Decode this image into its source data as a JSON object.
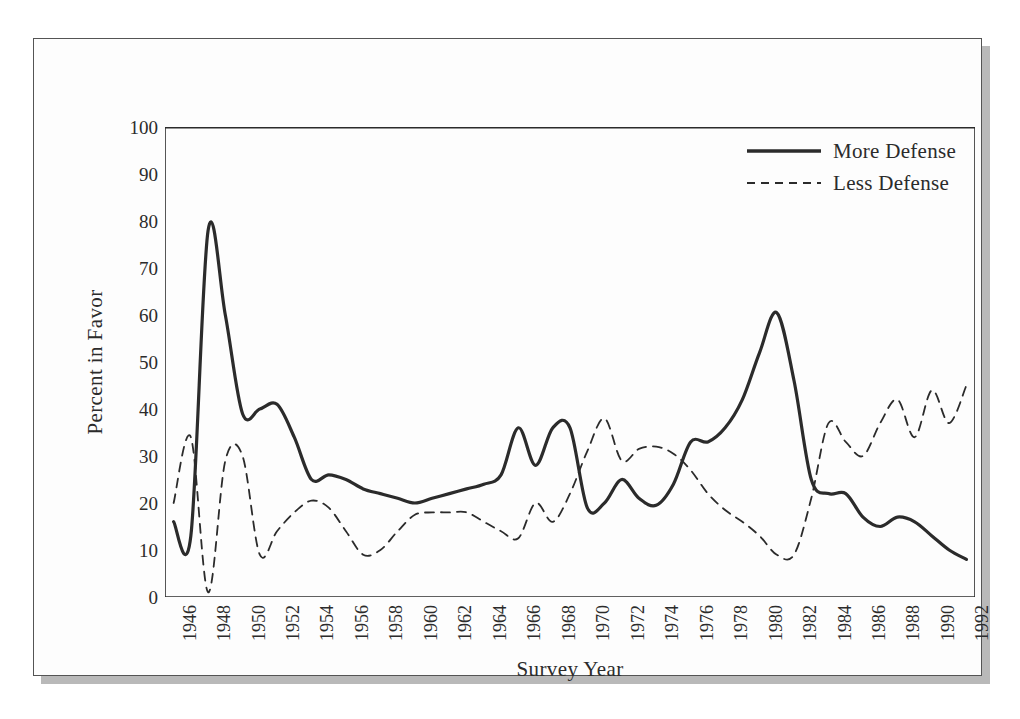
{
  "figure": {
    "frame_color": "#545454",
    "paper_color": "#fdfdfd",
    "shadow_color": "#b9b9b9",
    "line_color": "#2b2b2b"
  },
  "chart_data": {
    "type": "line",
    "title": "",
    "subtitle": "",
    "xlabel": "Survey Year",
    "ylabel": "Percent in Favor",
    "xlim": [
      1945.5,
      1992.5
    ],
    "ylim": [
      0,
      100
    ],
    "grid": false,
    "legend_position": "top-right",
    "y_ticks": [
      0,
      10,
      20,
      30,
      40,
      50,
      60,
      70,
      80,
      90,
      100
    ],
    "y_tick_labels": [
      "0",
      "10",
      "20",
      "30",
      "40",
      "50",
      "60",
      "70",
      "80",
      "90",
      "100"
    ],
    "x_ticks_minor_every": 1,
    "x_tick_labels": [
      "1946",
      "1948",
      "1950",
      "1952",
      "1954",
      "1956",
      "1958",
      "1960",
      "1962",
      "1964",
      "1966",
      "1968",
      "1970",
      "1972",
      "1974",
      "1976",
      "1978",
      "1980",
      "1982",
      "1984",
      "1986",
      "1988",
      "1990",
      "1992"
    ],
    "x_tick_label_rotation": -90,
    "x": [
      1946,
      1947,
      1948,
      1949,
      1950,
      1951,
      1952,
      1953,
      1954,
      1955,
      1956,
      1957,
      1958,
      1959,
      1960,
      1961,
      1962,
      1963,
      1964,
      1965,
      1966,
      1967,
      1968,
      1969,
      1970,
      1971,
      1972,
      1973,
      1974,
      1975,
      1976,
      1977,
      1978,
      1979,
      1980,
      1981,
      1982,
      1983,
      1984,
      1985,
      1986,
      1987,
      1988,
      1989,
      1990,
      1991,
      1992
    ],
    "series": [
      {
        "name": "More Defense",
        "style": "solid",
        "width": 3.2,
        "color": "#2b2b2b",
        "values": [
          16,
          13,
          78,
          60,
          39,
          40,
          41,
          34,
          25,
          26,
          25,
          23,
          22,
          21,
          20,
          21,
          22,
          23,
          24,
          26,
          36,
          28,
          36,
          36,
          19,
          20,
          25,
          21,
          19.5,
          24,
          33,
          33,
          36,
          42,
          52,
          60.5,
          46,
          25,
          22,
          22,
          17,
          15,
          17,
          16,
          13,
          10,
          8
        ]
      },
      {
        "name": "Less Defense",
        "style": "dashed",
        "width": 1.8,
        "color": "#2b2b2b",
        "values": [
          20,
          34,
          1,
          29,
          30,
          9,
          14,
          18,
          20.5,
          19,
          14,
          9,
          10,
          14,
          17.5,
          18,
          18,
          18,
          16,
          14,
          12.5,
          20,
          16,
          22,
          31,
          38,
          29,
          31.5,
          32,
          30.5,
          27,
          22,
          18.5,
          16,
          13,
          9,
          9,
          21,
          37,
          33,
          30,
          37,
          42,
          34,
          44,
          37,
          45
        ]
      }
    ]
  },
  "legend": {
    "entries": [
      {
        "label": "More Defense",
        "style": "solid"
      },
      {
        "label": "Less Defense",
        "style": "dashed"
      }
    ]
  }
}
